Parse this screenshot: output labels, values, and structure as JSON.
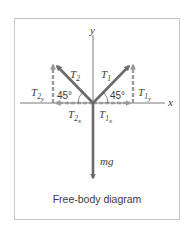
{
  "diagram": {
    "title": "Free-body diagram",
    "axes": {
      "x_label": "x",
      "y_label": "y"
    },
    "forces": [
      {
        "name": "T1",
        "label_main": "T",
        "label_sub": "1",
        "direction": "up-right",
        "angle": "45°"
      },
      {
        "name": "T2",
        "label_main": "T",
        "label_sub": "2",
        "direction": "up-left",
        "angle": "45°"
      },
      {
        "name": "mg",
        "label_main": "mg",
        "direction": "down"
      }
    ],
    "components": [
      {
        "name": "T1x",
        "label_main": "T",
        "label_sub": "1",
        "label_subsub": "x",
        "style": "dashed"
      },
      {
        "name": "T1y",
        "label_main": "T",
        "label_sub": "1",
        "label_subsub": "y",
        "style": "dashed"
      },
      {
        "name": "T2x",
        "label_main": "T",
        "label_sub": "2",
        "label_subsub": "x",
        "style": "dashed"
      },
      {
        "name": "T2y",
        "label_main": "T",
        "label_sub": "2",
        "label_subsub": "y",
        "style": "dashed"
      }
    ],
    "angle_labels": {
      "left": "45°",
      "right": "45°"
    },
    "colors": {
      "force_arrow": "#6b6b6b",
      "component_arrow": "#9a9a9a",
      "axis": "#555555",
      "text": "#3a3a3a",
      "frame_border": "#c8c8c8"
    }
  }
}
